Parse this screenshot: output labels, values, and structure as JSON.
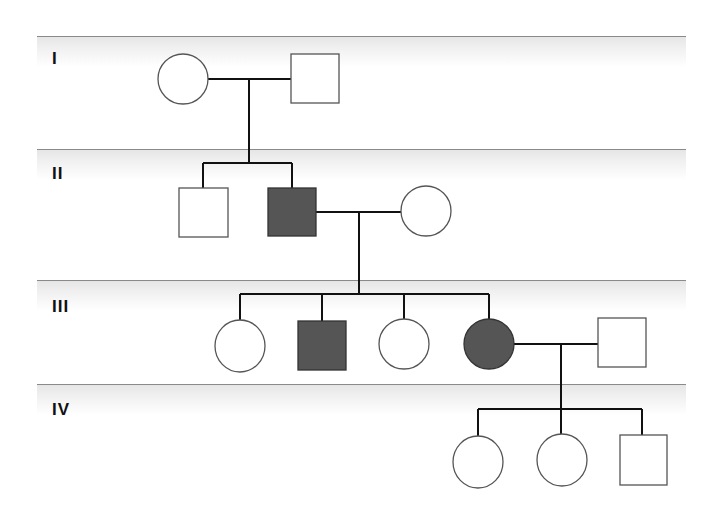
{
  "pedigree": {
    "generations": [
      {
        "label": "I",
        "band_y": 36,
        "label_y": 49
      },
      {
        "label": "II",
        "band_y": 149,
        "label_y": 164
      },
      {
        "label": "III",
        "band_y": 280,
        "label_y": 297
      },
      {
        "label": "IV",
        "band_y": 384,
        "label_y": 400
      }
    ],
    "colors": {
      "affected_fill": "#555555",
      "affected_stroke": "#333333",
      "unaffected_fill": "#ffffff",
      "symbol_stroke": "#555555",
      "line": "#111111",
      "band_line": "#8a8a8a"
    },
    "individuals": [
      {
        "id": "I-1",
        "generation": "I",
        "sex": "female",
        "affected": false
      },
      {
        "id": "I-2",
        "generation": "I",
        "sex": "male",
        "affected": false
      },
      {
        "id": "II-1",
        "generation": "II",
        "sex": "male",
        "affected": false
      },
      {
        "id": "II-2",
        "generation": "II",
        "sex": "male",
        "affected": true
      },
      {
        "id": "II-3",
        "generation": "II",
        "sex": "female",
        "affected": false
      },
      {
        "id": "III-1",
        "generation": "III",
        "sex": "female",
        "affected": false
      },
      {
        "id": "III-2",
        "generation": "III",
        "sex": "male",
        "affected": true
      },
      {
        "id": "III-3",
        "generation": "III",
        "sex": "female",
        "affected": false
      },
      {
        "id": "III-4",
        "generation": "III",
        "sex": "female",
        "affected": true
      },
      {
        "id": "III-5",
        "generation": "III",
        "sex": "male",
        "affected": false
      },
      {
        "id": "IV-1",
        "generation": "IV",
        "sex": "female",
        "affected": false
      },
      {
        "id": "IV-2",
        "generation": "IV",
        "sex": "female",
        "affected": false
      },
      {
        "id": "IV-3",
        "generation": "IV",
        "sex": "male",
        "affected": false
      }
    ],
    "matings": [
      {
        "partners": [
          "I-1",
          "I-2"
        ],
        "children": [
          "II-1",
          "II-2"
        ]
      },
      {
        "partners": [
          "II-2",
          "II-3"
        ],
        "children": [
          "III-1",
          "III-2",
          "III-3",
          "III-4"
        ]
      },
      {
        "partners": [
          "III-4",
          "III-5"
        ],
        "children": [
          "IV-1",
          "IV-2",
          "IV-3"
        ]
      }
    ]
  }
}
